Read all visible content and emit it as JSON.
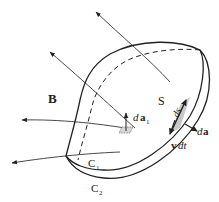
{
  "figure": {
    "labels": {
      "field": "B",
      "surface": "S",
      "curve1": "C",
      "curve1_sub": "1",
      "curve2": "C",
      "curve2_sub": "2",
      "area_element_d": "d",
      "area_element_a": "a",
      "area_element_sub": "1",
      "ds": "ds",
      "da_d": "d",
      "da_a": "a",
      "vdt_v": "v",
      "vdt_dt": "dt"
    },
    "colors": {
      "stroke": "#222222",
      "shade": "#c8c8c8",
      "background": "#ffffff"
    }
  }
}
